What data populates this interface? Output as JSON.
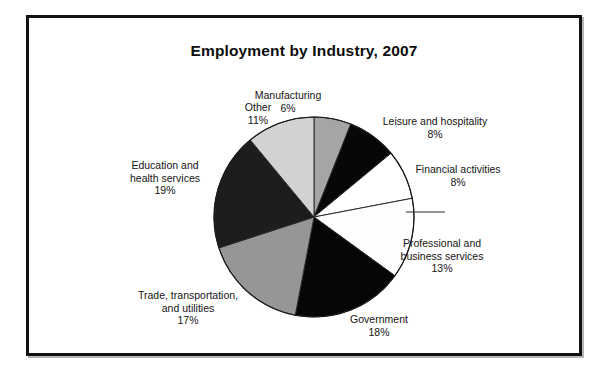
{
  "figure": {
    "title": "Employment by Industry, 2007",
    "border_color": "#111111",
    "background": "#ffffff"
  },
  "chart_data": {
    "type": "pie",
    "title": "Employment by Industry, 2007",
    "xlabel": "",
    "ylabel": "",
    "units": "percent",
    "start_angle_deg": 0,
    "direction": "clockwise",
    "total": 100,
    "legend": "none-labels-outside",
    "grid": false,
    "categories": [
      "Manufacturing",
      "Leisure and hospitality",
      "Financial activities",
      "Professional and business services",
      "Government",
      "Trade, transportation, and utilities",
      "Education and health services",
      "Other"
    ],
    "values": [
      6,
      8,
      8,
      13,
      18,
      17,
      19,
      11
    ],
    "value_labels": [
      "6%",
      "8%",
      "8%",
      "13%",
      "18%",
      "17%",
      "19%",
      "11%"
    ],
    "colors": [
      "#a5a5a5",
      "#070707",
      "#ffffff",
      "#fdfdfd",
      "#060606",
      "#969696",
      "#1d1d1d",
      "#d2d2d2"
    ],
    "slices": [
      {
        "name": "Manufacturing",
        "value": 6,
        "label": "Manufacturing",
        "pct": "6%",
        "color": "#a5a5a5"
      },
      {
        "name": "Leisure and hospitality",
        "value": 8,
        "label": "Leisure and hospitality",
        "pct": "8%",
        "color": "#070707"
      },
      {
        "name": "Financial activities",
        "value": 8,
        "label": "Financial activities",
        "pct": "8%",
        "color": "#ffffff"
      },
      {
        "name": "Professional and business services",
        "value": 13,
        "label": "Professional and business services",
        "pct": "13%",
        "color": "#fdfdfd"
      },
      {
        "name": "Government",
        "value": 18,
        "label": "Government",
        "pct": "18%",
        "color": "#060606"
      },
      {
        "name": "Trade, transportation, and utilities",
        "value": 17,
        "label": "Trade, transportation, and utilities",
        "pct": "17%",
        "color": "#969696"
      },
      {
        "name": "Education and health services",
        "value": 19,
        "label": "Education and health services",
        "pct": "19%",
        "color": "#1d1d1d"
      },
      {
        "name": "Other",
        "value": 11,
        "label": "Other",
        "pct": "11%",
        "color": "#d2d2d2"
      }
    ]
  },
  "labels": {
    "manufacturing": {
      "line1": "Manufacturing",
      "pct": "6%"
    },
    "leisure": {
      "line1": "Leisure and hospitality",
      "pct": "8%"
    },
    "financial": {
      "line1": "Financial activities",
      "pct": "8%"
    },
    "professional": {
      "line1": "Professional and",
      "line2": "business services",
      "pct": "13%"
    },
    "government": {
      "line1": "Government",
      "pct": "18%"
    },
    "trade": {
      "line1": "Trade, transportation,",
      "line2": "and utilities",
      "pct": "17%"
    },
    "education": {
      "line1": "Education and",
      "line2": "health services",
      "pct": "19%"
    },
    "other": {
      "line1": "Other",
      "pct": "11%"
    }
  }
}
